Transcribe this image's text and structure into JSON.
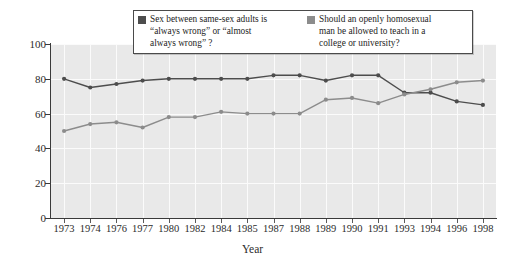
{
  "chart_data": {
    "type": "line",
    "title": "",
    "xlabel": "Year",
    "ylabel": "Percentage answering “yes”",
    "categories": [
      "1973",
      "1974",
      "1976",
      "1977",
      "1980",
      "1982",
      "1984",
      "1985",
      "1987",
      "1988",
      "1989",
      "1990",
      "1991",
      "1993",
      "1994",
      "1996",
      "1998"
    ],
    "ylim": [
      0,
      100
    ],
    "yticks": [
      0,
      20,
      40,
      60,
      80,
      100
    ],
    "grid": true,
    "legend_position": "top-center",
    "series": [
      {
        "name": "Sex between same-sex adults is “always wrong”  or “almost always wrong” ?",
        "color": "#4d4d4d",
        "values": [
          80,
          75,
          77,
          79,
          80,
          80,
          80,
          80,
          82,
          82,
          79,
          82,
          82,
          72,
          72,
          67,
          65
        ]
      },
      {
        "name": "Should an openly homosexual man be allowed to teach in a college or university?",
        "color": "#8c8c8c",
        "values": [
          50,
          54,
          55,
          52,
          58,
          58,
          61,
          60,
          60,
          60,
          68,
          69,
          66,
          71,
          74,
          78,
          79
        ]
      }
    ]
  },
  "legend": {
    "entries": [
      {
        "swatch_color": "#4d4d4d",
        "line1": "Sex between same-sex adults is",
        "line2": "“always wrong”  or “almost",
        "line3": "always wrong” ?"
      },
      {
        "swatch_color": "#8c8c8c",
        "line1": "Should an openly homosexual",
        "line2": "man be allowed to teach in a",
        "line3": "college or university?"
      }
    ]
  },
  "axes": {
    "y_title": "Percentage answering “yes”",
    "x_title": "Year",
    "y_tick_labels": [
      "100",
      "80",
      "60",
      "40",
      "20",
      "0"
    ],
    "x_tick_labels": [
      "1973",
      "1974",
      "1976",
      "1977",
      "1980",
      "1982",
      "1984",
      "1985",
      "1987",
      "1988",
      "1989",
      "1990",
      "1991",
      "1993",
      "1994",
      "1996",
      "1998"
    ]
  },
  "colors": {
    "plot_background": "#e9e9e9",
    "gridline": "#fbfbfb",
    "axis": "#3a3a3a",
    "series_dark": "#4d4d4d",
    "series_light": "#8c8c8c",
    "text": "#2b2b2b"
  }
}
